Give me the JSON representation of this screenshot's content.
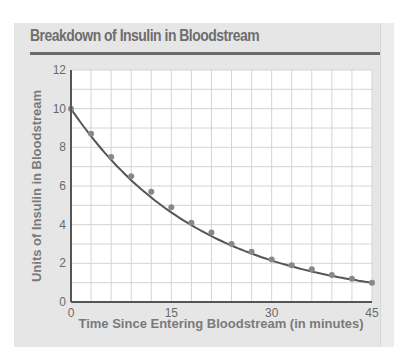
{
  "title": "Breakdown of Insulin in Bloodstream",
  "colors": {
    "panel": "#e6e6e6",
    "plot_bg": "#ffffff",
    "grid": "#d4d4d4",
    "axis": "#555555",
    "curve": "#555555",
    "point": "#888888",
    "text": "#6a6a6a"
  },
  "chart_data": {
    "type": "scatter",
    "title": "Breakdown of Insulin in Bloodstream",
    "xlabel": "Time Since Entering Bloodstream (in minutes)",
    "ylabel": "Units of Insulin in Bloodstream",
    "xlim": [
      0,
      45
    ],
    "ylim": [
      0,
      12
    ],
    "x_ticks": [
      0,
      15,
      30,
      45
    ],
    "y_ticks": [
      0,
      2,
      4,
      6,
      8,
      10,
      12
    ],
    "grid": {
      "x_step": 3,
      "y_step": 1
    },
    "series": [
      {
        "name": "Measured insulin",
        "type": "scatter",
        "x": [
          0,
          3,
          6,
          9,
          12,
          15,
          18,
          21,
          24,
          27,
          30,
          33,
          36,
          39,
          42,
          45
        ],
        "y": [
          10.0,
          8.7,
          7.5,
          6.5,
          5.7,
          4.9,
          4.1,
          3.6,
          3.0,
          2.6,
          2.2,
          1.9,
          1.7,
          1.4,
          1.2,
          1.0
        ]
      },
      {
        "name": "Exponential fit",
        "type": "line",
        "formula": "y = 10 * 0.95^x"
      }
    ]
  }
}
